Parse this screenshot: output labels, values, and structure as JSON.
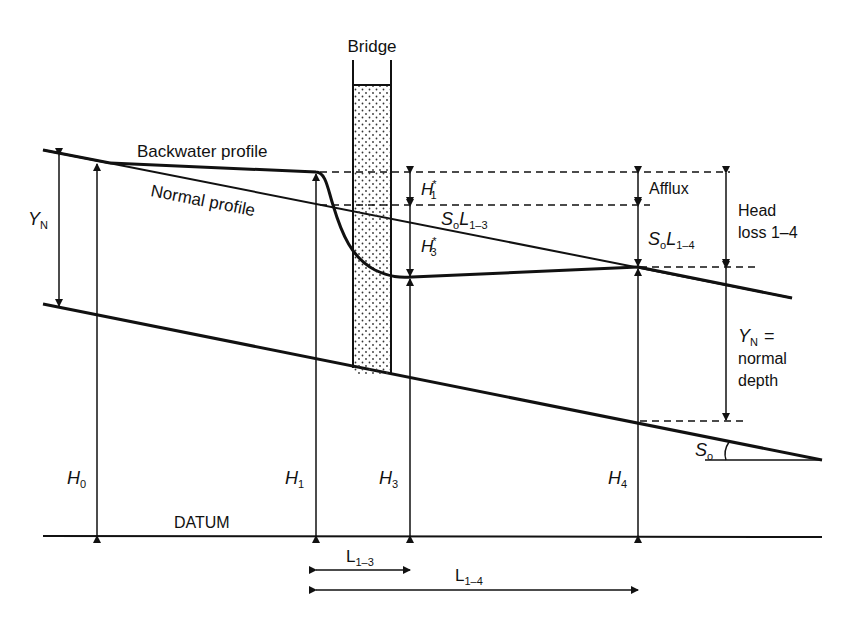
{
  "diagram": {
    "colors": {
      "ink": "#111111",
      "background": "#ffffff"
    },
    "labels": {
      "bridge": "Bridge",
      "backwater_profile": "Backwater profile",
      "normal_profile": "Normal profile",
      "datum": "DATUM",
      "afflux": "Afflux",
      "head_loss_line1": "Head",
      "head_loss_line2": "loss 1–4",
      "normal_depth_eq": "=",
      "normal_depth_line2": "normal",
      "normal_depth_line3": "depth"
    },
    "symbols": {
      "YN_left": {
        "main": "Y",
        "sub": "N"
      },
      "YN_right": {
        "main": "Y",
        "sub": "N"
      },
      "H0": {
        "main": "H",
        "sub": "0"
      },
      "H1": {
        "main": "H",
        "sub": "1"
      },
      "H3": {
        "main": "H",
        "sub": "3"
      },
      "H4": {
        "main": "H",
        "sub": "4"
      },
      "H1_star": {
        "main": "H",
        "sub": "1",
        "sup": "*"
      },
      "H3_star": {
        "main": "H",
        "sub": "3",
        "sup": "*"
      },
      "SoL13": {
        "s": "S",
        "s_sub": "o",
        "l": "L",
        "l_sub": "1–3"
      },
      "SoL14": {
        "s": "S",
        "s_sub": "o",
        "l": "L",
        "l_sub": "1–4"
      },
      "So_angle": {
        "main": "S",
        "sub": "o"
      },
      "L13": {
        "main": "L",
        "sub": "1–3"
      },
      "L14": {
        "main": "L",
        "sub": "1–4"
      }
    }
  }
}
